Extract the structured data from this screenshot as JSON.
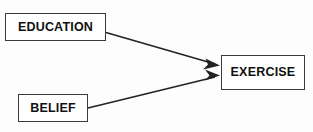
{
  "diagram": {
    "type": "path-diagram",
    "background_color": "#fdfdfd",
    "line_color": "#222222",
    "box_border_color": "#3a3a3a",
    "box_fill_color": "#ffffff",
    "text_color": "#111111",
    "nodes": [
      {
        "id": "education",
        "label": "EDUCATION"
      },
      {
        "id": "belief",
        "label": "BELIEF"
      },
      {
        "id": "exercise",
        "label": "EXERCISE"
      }
    ],
    "edges": [
      {
        "id": "education-to-exercise",
        "from": "EDUCATION",
        "to": "EXERCISE",
        "arrow": "single"
      },
      {
        "id": "belief-to-exercise",
        "from": "BELIEF",
        "to": "EXERCISE",
        "arrow": "single"
      }
    ]
  }
}
